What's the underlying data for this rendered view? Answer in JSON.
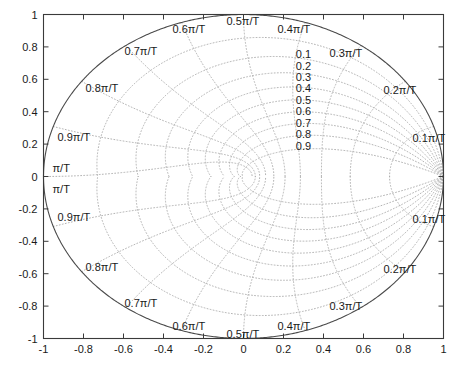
{
  "figure": {
    "title": "",
    "background_color": "#ffffff",
    "axis_color": "#3a3a3a",
    "grid_color": "#a9a9a9",
    "unit_circle_color": "#4a4a4a",
    "text_color": "#1a1a1a"
  },
  "chart_data": {
    "type": "line",
    "plot_kind": "z-plane-zgrid",
    "title": "",
    "xlabel": "",
    "ylabel": "",
    "xlim": [
      -1,
      1
    ],
    "ylim": [
      -1,
      1
    ],
    "grid": true,
    "grid_style": "dotted",
    "legend": "none",
    "xticks": [
      -1,
      -0.8,
      -0.6,
      -0.4,
      -0.2,
      0,
      0.2,
      0.4,
      0.6,
      0.8,
      1
    ],
    "xticklabels": [
      "-1",
      "-0.8",
      "-0.6",
      "-0.4",
      "-0.2",
      "0",
      "0.2",
      "0.4",
      "0.6",
      "0.8",
      "1"
    ],
    "yticks": [
      -1,
      -0.8,
      -0.6,
      -0.4,
      -0.2,
      0,
      0.2,
      0.4,
      0.6,
      0.8,
      1
    ],
    "yticklabels": [
      "-1",
      "-0.8",
      "-0.6",
      "-0.4",
      "-0.2",
      "0",
      "0.2",
      "0.4",
      "0.6",
      "0.8",
      "1"
    ],
    "unit_circle": {
      "center": [
        0,
        0
      ],
      "radius": 1
    },
    "damping_ratios": [
      0.1,
      0.2,
      0.3,
      0.4,
      0.5,
      0.6,
      0.7,
      0.8,
      0.9
    ],
    "damping_labels": [
      "0.1",
      "0.2",
      "0.3",
      "0.4",
      "0.5",
      "0.6",
      "0.7",
      "0.8",
      "0.9"
    ],
    "normalized_frequencies": [
      0.1,
      0.2,
      0.3,
      0.4,
      0.5,
      0.6,
      0.7,
      0.8,
      0.9,
      1.0
    ],
    "frequency_labels_upper": [
      {
        "text": "0.1π/T",
        "wn": 0.1
      },
      {
        "text": "0.2π/T",
        "wn": 0.2
      },
      {
        "text": "0.3π/T",
        "wn": 0.3
      },
      {
        "text": "0.4π/T",
        "wn": 0.4
      },
      {
        "text": "0.5π/T",
        "wn": 0.5
      },
      {
        "text": "0.6π/T",
        "wn": 0.6
      },
      {
        "text": "0.7π/T",
        "wn": 0.7
      },
      {
        "text": "0.8π/T",
        "wn": 0.8
      },
      {
        "text": "0.9π/T",
        "wn": 0.9
      },
      {
        "text": "π/T",
        "wn": 1.0
      }
    ],
    "frequency_labels_lower": [
      {
        "text": "0.1π/T",
        "wn": 0.1
      },
      {
        "text": "0.2π/T",
        "wn": 0.2
      },
      {
        "text": "0.3π/T",
        "wn": 0.3
      },
      {
        "text": "0.4π/T",
        "wn": 0.4
      },
      {
        "text": "0.5π/T",
        "wn": 0.5
      },
      {
        "text": "0.6π/T",
        "wn": 0.6
      },
      {
        "text": "0.7π/T",
        "wn": 0.7
      },
      {
        "text": "0.8π/T",
        "wn": 0.8
      },
      {
        "text": "0.9π/T",
        "wn": 0.9
      },
      {
        "text": "π/T",
        "wn": 1.0
      }
    ]
  },
  "labels": {
    "damping_column": {
      "values": [
        "0.1",
        "0.2",
        "0.3",
        "0.4",
        "0.5",
        "0.6",
        "0.7",
        "0.8",
        "0.9"
      ],
      "x_data": 0.3,
      "y_top_data": 0.755,
      "y_step_data": 0.0705
    },
    "freq_upper": [
      {
        "text": "0.1π/T",
        "x": 0.845,
        "y": 0.235,
        "anchor": "start"
      },
      {
        "text": "0.2π/T",
        "x": 0.7,
        "y": 0.535,
        "anchor": "start"
      },
      {
        "text": "0.3π/T",
        "x": 0.43,
        "y": 0.76,
        "anchor": "start"
      },
      {
        "text": "0.4π/T",
        "x": 0.17,
        "y": 0.91,
        "anchor": "start"
      },
      {
        "text": "0.5π/T",
        "x": -0.085,
        "y": 0.96,
        "anchor": "start"
      },
      {
        "text": "0.6π/T",
        "x": -0.355,
        "y": 0.91,
        "anchor": "start"
      },
      {
        "text": "0.7π/T",
        "x": -0.595,
        "y": 0.775,
        "anchor": "start"
      },
      {
        "text": "0.8π/T",
        "x": -0.79,
        "y": 0.545,
        "anchor": "start"
      },
      {
        "text": "0.9π/T",
        "x": -0.93,
        "y": 0.245,
        "anchor": "start"
      },
      {
        "text": "π/T",
        "x": -0.955,
        "y": 0.055,
        "anchor": "start"
      }
    ],
    "freq_lower": [
      {
        "text": "π/T",
        "x": -0.955,
        "y": -0.075,
        "anchor": "start"
      },
      {
        "text": "0.9π/T",
        "x": -0.93,
        "y": -0.25,
        "anchor": "start"
      },
      {
        "text": "0.8π/T",
        "x": -0.79,
        "y": -0.56,
        "anchor": "start"
      },
      {
        "text": "0.7π/T",
        "x": -0.595,
        "y": -0.78,
        "anchor": "start"
      },
      {
        "text": "0.6π/T",
        "x": -0.355,
        "y": -0.92,
        "anchor": "start"
      },
      {
        "text": "0.5π/T",
        "x": -0.085,
        "y": -0.975,
        "anchor": "start"
      },
      {
        "text": "0.4π/T",
        "x": 0.17,
        "y": -0.925,
        "anchor": "start"
      },
      {
        "text": "0.3π/T",
        "x": 0.43,
        "y": -0.8,
        "anchor": "start"
      },
      {
        "text": "0.2π/T",
        "x": 0.7,
        "y": -0.57,
        "anchor": "start"
      },
      {
        "text": "0.1π/T",
        "x": 0.845,
        "y": -0.26,
        "anchor": "start"
      }
    ]
  }
}
